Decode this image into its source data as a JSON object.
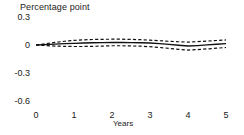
{
  "chart_data": {
    "type": "line",
    "title": "Percentage point",
    "xlabel": "Years",
    "ylabel": "",
    "xlim": [
      0,
      5
    ],
    "ylim": [
      -0.6,
      0.3
    ],
    "grid": false,
    "legend": "none",
    "y_ticks": [
      "0.3",
      "0",
      "-0.3",
      "-0.6"
    ],
    "y_tick_values": [
      0.3,
      0,
      -0.3,
      -0.6
    ],
    "x_ticks": [
      "0",
      "1",
      "2",
      "3",
      "4",
      "5"
    ],
    "x_tick_values": [
      0,
      1,
      2,
      3,
      4,
      5
    ],
    "x": [
      0,
      0.25,
      0.5,
      0.75,
      1,
      1.25,
      1.5,
      1.75,
      2,
      2.25,
      2.5,
      2.75,
      3,
      3.25,
      3.5,
      3.75,
      4,
      4.25,
      4.5,
      4.75,
      5
    ],
    "series": [
      {
        "name": "Point estimate",
        "style": "solid",
        "values": [
          0.0,
          0.004,
          0.009,
          0.014,
          0.018,
          0.021,
          0.024,
          0.026,
          0.027,
          0.027,
          0.026,
          0.024,
          0.021,
          0.014,
          0.006,
          -0.003,
          -0.011,
          -0.006,
          0.001,
          0.008,
          0.014
        ]
      },
      {
        "name": "Upper confidence band",
        "style": "dashed",
        "values": [
          0.0,
          0.014,
          0.028,
          0.04,
          0.049,
          0.055,
          0.059,
          0.061,
          0.062,
          0.062,
          0.06,
          0.057,
          0.052,
          0.046,
          0.04,
          0.035,
          0.031,
          0.036,
          0.042,
          0.048,
          0.054
        ]
      },
      {
        "name": "Lower confidence band",
        "style": "dashed",
        "values": [
          0.0,
          -0.006,
          -0.011,
          -0.014,
          -0.016,
          -0.016,
          -0.014,
          -0.011,
          -0.008,
          -0.008,
          -0.01,
          -0.013,
          -0.018,
          -0.026,
          -0.036,
          -0.046,
          -0.054,
          -0.049,
          -0.042,
          -0.034,
          -0.027
        ]
      }
    ]
  }
}
